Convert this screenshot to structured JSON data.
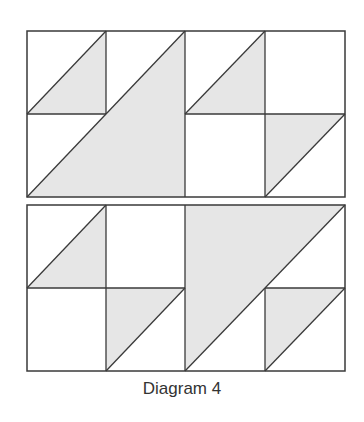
{
  "caption": "Diagram 4",
  "colors": {
    "shade": "#e6e6e6",
    "line": "#3a3a3a",
    "background": "#ffffff"
  },
  "blocks": [
    {
      "name": "top-block",
      "rect": [
        27,
        31,
        318,
        166
      ],
      "shaded": [
        [
          [
            27,
            114
          ],
          [
            106,
            31
          ],
          [
            106,
            114
          ]
        ],
        [
          [
            27,
            197
          ],
          [
            185,
            31
          ],
          [
            185,
            197
          ]
        ],
        [
          [
            185,
            114
          ],
          [
            265,
            31
          ],
          [
            265,
            114
          ]
        ],
        [
          [
            265,
            114
          ],
          [
            345,
            114
          ],
          [
            265,
            197
          ]
        ]
      ],
      "lines": [
        [
          106,
          31,
          106,
          114
        ],
        [
          27,
          114,
          106,
          114
        ],
        [
          185,
          31,
          185,
          197
        ],
        [
          265,
          31,
          265,
          197
        ],
        [
          185,
          114,
          345,
          114
        ],
        [
          27,
          114,
          106,
          31
        ],
        [
          27,
          197,
          185,
          31
        ],
        [
          185,
          114,
          265,
          31
        ],
        [
          265,
          197,
          345,
          114
        ]
      ]
    },
    {
      "name": "bottom-block",
      "rect": [
        27,
        205,
        318,
        166
      ],
      "shaded": [
        [
          [
            27,
            288
          ],
          [
            106,
            205
          ],
          [
            106,
            288
          ]
        ],
        [
          [
            106,
            288
          ],
          [
            185,
            288
          ],
          [
            106,
            371
          ]
        ],
        [
          [
            185,
            205
          ],
          [
            345,
            205
          ],
          [
            185,
            371
          ]
        ],
        [
          [
            265,
            288
          ],
          [
            345,
            288
          ],
          [
            265,
            371
          ]
        ]
      ],
      "lines": [
        [
          106,
          205,
          106,
          371
        ],
        [
          185,
          205,
          185,
          371
        ],
        [
          265,
          288,
          265,
          371
        ],
        [
          27,
          288,
          185,
          288
        ],
        [
          265,
          288,
          345,
          288
        ],
        [
          27,
          288,
          106,
          205
        ],
        [
          106,
          371,
          185,
          288
        ],
        [
          185,
          371,
          345,
          205
        ],
        [
          265,
          371,
          345,
          288
        ]
      ]
    }
  ]
}
